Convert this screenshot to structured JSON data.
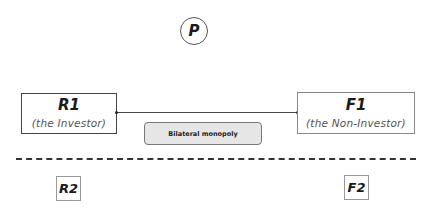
{
  "diagram": {
    "top_node": {
      "label": "P",
      "shape": "circle"
    },
    "upper_tier": {
      "left_node": {
        "title": "R1",
        "subtitle": "(the Investor)"
      },
      "right_node": {
        "title": "F1",
        "subtitle": "(the Non-Investor)"
      },
      "connection": {
        "from": "R1",
        "to": "F1",
        "style": "solid line"
      },
      "relationship_label": "Bilateral monopoly"
    },
    "divider": {
      "style": "dashed"
    },
    "lower_tier": {
      "left_node": {
        "title": "R2"
      },
      "right_node": {
        "title": "F2"
      }
    }
  }
}
